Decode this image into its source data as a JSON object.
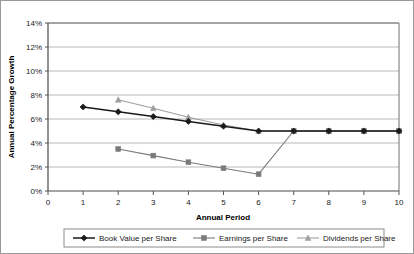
{
  "chart_data": {
    "type": "line",
    "title": "",
    "xlabel": "Annual Period",
    "ylabel": "Annual Percentage Growth",
    "x": [
      1,
      2,
      3,
      4,
      5,
      6,
      7,
      8,
      9,
      10
    ],
    "xlim": [
      0,
      10
    ],
    "ylim": [
      0,
      14
    ],
    "xticks": [
      "0",
      "1",
      "2",
      "3",
      "4",
      "5",
      "6",
      "7",
      "8",
      "9",
      "10"
    ],
    "yticks": [
      "0%",
      "2%",
      "4%",
      "6%",
      "8%",
      "10%",
      "12%",
      "14%"
    ],
    "grid": "horizontal",
    "legend_position": "bottom",
    "series": [
      {
        "name": "Book Value per Share",
        "marker": "diamond",
        "color": "#1a1a1a",
        "x": [
          1,
          2,
          3,
          4,
          5,
          6,
          7,
          8,
          9,
          10
        ],
        "values": [
          7.0,
          6.6,
          6.2,
          5.8,
          5.4,
          5.0,
          5.0,
          5.0,
          5.0,
          5.0
        ]
      },
      {
        "name": "Earnings per Share",
        "marker": "square",
        "color": "#7a7a7a",
        "x": [
          2,
          3,
          4,
          5,
          6,
          7,
          8,
          9,
          10
        ],
        "values": [
          3.5,
          2.95,
          2.4,
          1.9,
          1.4,
          5.0,
          5.0,
          5.0,
          5.0
        ]
      },
      {
        "name": "Dividends per Share",
        "marker": "triangle",
        "color": "#9e9e9e",
        "x": [
          2,
          3,
          4,
          5,
          6,
          7,
          8,
          9,
          10
        ],
        "values": [
          7.6,
          6.9,
          6.15,
          5.5,
          5.0,
          5.0,
          5.0,
          5.0,
          5.0
        ]
      }
    ]
  },
  "colors": {
    "grid": "#b8b8b8",
    "axis": "#555555",
    "border": "#9a9a9a",
    "background": "#ffffff",
    "series_book_value": "#1a1a1a",
    "series_earnings": "#7a7a7a",
    "series_dividends": "#9e9e9e"
  }
}
